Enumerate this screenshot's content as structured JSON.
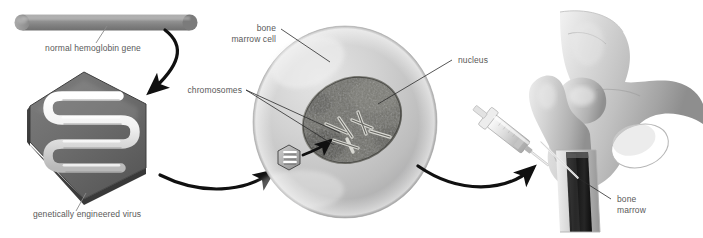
{
  "figure": {
    "type": "biological-process-diagram",
    "background_color": "#ffffff",
    "label_color": "#595959",
    "stroke_color": "#111111"
  },
  "labels": {
    "normal_gene": "normal hemoglobin gene",
    "engineered_virus": "genetically engineered virus",
    "bone_marrow_cell_line1": "bone",
    "bone_marrow_cell_line2": "marrow cell",
    "chromosomes": "chromosomes",
    "nucleus": "nucleus",
    "bone_marrow_line1": "bone",
    "bone_marrow_line2": "marrow"
  },
  "stages": [
    {
      "id": "gene-rod",
      "name": "normal hemoglobin gene",
      "shape": "cylinder",
      "color": "#8e8e8e"
    },
    {
      "id": "virus-hexagon",
      "name": "genetically engineered virus",
      "shape": "hexagon",
      "color": "#6b6b6b",
      "payload": "serpentine white gene strand"
    },
    {
      "id": "bone-marrow-cell",
      "name": "bone marrow cell",
      "shape": "sphere",
      "color": "#c9c9c9",
      "contains": [
        "nucleus",
        "chromosomes",
        "virus-particle"
      ]
    },
    {
      "id": "syringe",
      "name": "syringe",
      "color": "#d4d4d4"
    },
    {
      "id": "hip-bone",
      "name": "hip and femur bone",
      "color": "#c4c4c4",
      "contains": [
        "bone marrow"
      ]
    }
  ],
  "arrows": [
    {
      "id": "gene-to-virus",
      "from": "normal hemoglobin gene",
      "to": "genetically engineered virus"
    },
    {
      "id": "virus-to-cell",
      "from": "genetically engineered virus",
      "to": "bone marrow cell"
    },
    {
      "id": "virus-to-nucleus",
      "from": "virus particle",
      "to": "nucleus"
    },
    {
      "id": "cell-to-bone",
      "from": "bone marrow cell",
      "to": "bone marrow"
    }
  ]
}
